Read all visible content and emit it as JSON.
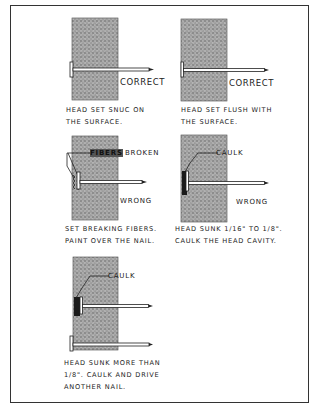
{
  "figure": {
    "panels": [
      {
        "id": "p1",
        "status_label": "CORRECT",
        "caption_lines": [
          "HEAD SET SNUC ON",
          "THE SURFACE."
        ],
        "callout": ""
      },
      {
        "id": "p2",
        "status_label": "CORRECT",
        "caption_lines": [
          "HEAD SET FLUSH WITH",
          "THE SURFACE."
        ],
        "callout": ""
      },
      {
        "id": "p3",
        "status_label": "WRONG",
        "callout": "FIBERS",
        "callout_suffix": "BROKEN",
        "caption_lines": [
          "SET BREAKING FIBERS.",
          "PAINT OVER THE NAIL."
        ]
      },
      {
        "id": "p4",
        "status_label": "WRONG",
        "callout": "CAULK",
        "caption_lines": [
          "HEAD SUNK 1/16\" TO 1/8\".",
          "CAULK THE HEAD CAVITY."
        ]
      },
      {
        "id": "p5",
        "status_label": "",
        "callout": "CAULK",
        "caption_lines": [
          "HEAD SUNK MORE THAN",
          "1/8\". CAULK AND DRIVE",
          "ANOTHER NAIL."
        ]
      }
    ],
    "colors": {
      "ink": "#222222",
      "board_fill": "#8c8c8c",
      "caulk": "#1a1a1a",
      "frame": "#333333"
    }
  }
}
